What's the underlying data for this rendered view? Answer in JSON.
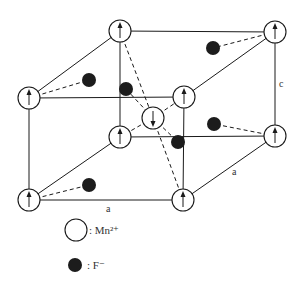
{
  "diagram": {
    "edge_labels": {
      "front_bottom": "a",
      "right_depth": "a",
      "right_vertical": "c"
    },
    "mn_atoms": [
      {
        "id": "back-top-left",
        "x": 120,
        "y": 31,
        "spin": "up"
      },
      {
        "id": "back-top-right",
        "x": 275,
        "y": 32,
        "spin": "up"
      },
      {
        "id": "front-top-left",
        "x": 29,
        "y": 98,
        "spin": "up"
      },
      {
        "id": "front-top-right",
        "x": 184,
        "y": 97,
        "spin": "up"
      },
      {
        "id": "center",
        "x": 153,
        "y": 118,
        "spin": "down"
      },
      {
        "id": "back-bottom-left",
        "x": 120,
        "y": 137,
        "spin": "up"
      },
      {
        "id": "back-bottom-right",
        "x": 275,
        "y": 136,
        "spin": "up"
      },
      {
        "id": "front-bottom-left",
        "x": 29,
        "y": 200,
        "spin": "up"
      },
      {
        "id": "front-bottom-right",
        "x": 183,
        "y": 200,
        "spin": "up"
      }
    ],
    "f_atoms": [
      {
        "x": 89,
        "y": 80
      },
      {
        "x": 126,
        "y": 89
      },
      {
        "x": 213,
        "y": 48
      },
      {
        "x": 178,
        "y": 142
      },
      {
        "x": 214,
        "y": 124
      },
      {
        "x": 89,
        "y": 185
      }
    ]
  },
  "legend": {
    "mn_label": ": Mn²⁺",
    "f_label": ": F⁻"
  }
}
